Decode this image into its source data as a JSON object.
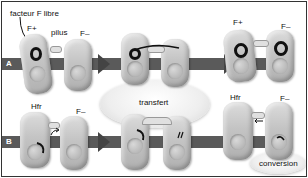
{
  "diagram": {
    "rows": [
      {
        "id": "A",
        "label": "A"
      },
      {
        "id": "B",
        "label": "B"
      }
    ],
    "labels": {
      "free_f_factor": "facteur F libre",
      "pilus": "pilus",
      "f_plus": "F+",
      "f_minus": "F–",
      "hfr": "Hfr",
      "transfer": "transfert",
      "conversion": "conversion"
    },
    "stages": [
      {
        "row": "A",
        "step": 1,
        "cells": [
          "F+",
          "F–"
        ],
        "annotations": [
          "facteur F libre",
          "pilus"
        ]
      },
      {
        "row": "A",
        "step": 2,
        "cells": [
          "F+",
          "F–"
        ],
        "annotations": []
      },
      {
        "row": "A",
        "step": 3,
        "cells": [
          "F+",
          "F+"
        ],
        "annotations": [
          "F+",
          "F–"
        ]
      },
      {
        "row": "B",
        "step": 1,
        "cells": [
          "Hfr",
          "F–"
        ],
        "annotations": [
          "Hfr",
          "F–"
        ]
      },
      {
        "row": "B",
        "step": 2,
        "cells": [
          "Hfr",
          "F–"
        ],
        "annotations": []
      },
      {
        "row": "B",
        "step": 3,
        "cells": [
          "Hfr",
          "F–"
        ],
        "annotations": [
          "Hfr",
          "F–",
          "conversion"
        ]
      }
    ],
    "colors": {
      "track": "#5a5a5a",
      "cell": "#c4c4c4",
      "plasmid": "#111111",
      "ellipse": "#eeeeee"
    }
  }
}
